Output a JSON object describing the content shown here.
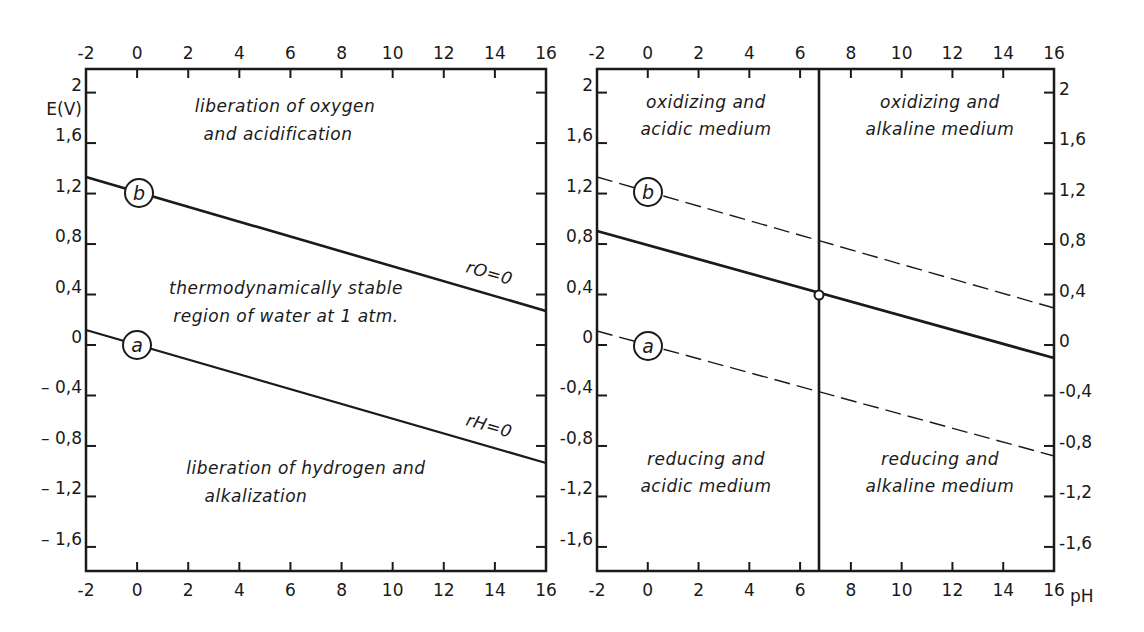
{
  "chart_data": [
    {
      "type": "line",
      "panel": "left",
      "title": "",
      "xlabel": "",
      "ylabel": "E(V)",
      "xlim": [
        -2,
        16
      ],
      "ylim": [
        -1.8,
        2.2
      ],
      "x_ticks": [
        "-2",
        "0",
        "2",
        "4",
        "6",
        "8",
        "10",
        "12",
        "14",
        "16"
      ],
      "y_ticks": [
        "2",
        "1,6",
        "1,2",
        "0,8",
        "0,4",
        "0",
        "– 0,4",
        "– 0,8",
        "– 1,2",
        "– 1,6"
      ],
      "grid": false,
      "series": [
        {
          "name": "b",
          "label": "rO=0",
          "style": "solid",
          "x": [
            -2,
            16
          ],
          "y": [
            1.33,
            0.27
          ]
        },
        {
          "name": "a",
          "label": "rH=0",
          "style": "solid",
          "x": [
            -2,
            16
          ],
          "y": [
            0.12,
            -0.94
          ]
        }
      ],
      "annotations": [
        "liberation of oxygen and acidification",
        "thermodynamically stable region of water at 1 atm.",
        "liberation of hydrogen and alkalization"
      ]
    },
    {
      "type": "line",
      "panel": "right",
      "title": "",
      "xlabel": "pH",
      "ylabel": "",
      "xlim": [
        -2,
        16
      ],
      "ylim": [
        -1.8,
        2.2
      ],
      "x_ticks": [
        "-2",
        "0",
        "2",
        "4",
        "6",
        "8",
        "10",
        "12",
        "14",
        "16"
      ],
      "y_ticks": [
        "2",
        "1,6",
        "1,2",
        "0,8",
        "0,4",
        "0",
        "-0,4",
        "-0,8",
        "-1,2",
        "-1,6"
      ],
      "grid": false,
      "series": [
        {
          "name": "b",
          "style": "dashed",
          "x": [
            -2,
            16
          ],
          "y": [
            1.33,
            0.27
          ]
        },
        {
          "name": "neutral",
          "style": "solid",
          "x": [
            -2,
            16
          ],
          "y": [
            0.93,
            -0.13
          ]
        },
        {
          "name": "a",
          "style": "dashed",
          "x": [
            -2,
            16
          ],
          "y": [
            0.12,
            -0.94
          ]
        },
        {
          "name": "pH 7",
          "style": "solid-vertical",
          "x": [
            7,
            7
          ],
          "y": [
            -1.8,
            2.2
          ]
        }
      ],
      "points": [
        {
          "x": 7,
          "y": 0.4,
          "marker": "open-circle"
        }
      ],
      "annotations": [
        "oxidizing and acidic medium",
        "oxidizing and alkaline medium",
        "reducing and acidic medium",
        "reducing and alkaline medium"
      ]
    }
  ],
  "labels": {
    "y_axis": "E(V)",
    "x_axis": "pH",
    "left": {
      "top_1": "liberation of oxygen",
      "top_2": "and acidification",
      "mid_1": "thermodynamically stable",
      "mid_2": "region of water at 1 atm.",
      "bot_1": "liberation of hydrogen and",
      "bot_2": "alkalization",
      "line_b": "rO=0",
      "line_a": "rH=0",
      "circle_b": "b",
      "circle_a": "a"
    },
    "right": {
      "tl_1": "oxidizing and",
      "tl_2": "acidic medium",
      "tr_1": "oxidizing and",
      "tr_2": "alkaline medium",
      "bl_1": "reducing and",
      "bl_2": "acidic medium",
      "br_1": "reducing and",
      "br_2": "alkaline medium",
      "circle_b": "b",
      "circle_a": "a"
    },
    "x_ticks": [
      "-2",
      "0",
      "2",
      "4",
      "6",
      "8",
      "10",
      "12",
      "14",
      "16"
    ],
    "left_y_ticks": [
      "2",
      "1,6",
      "1,2",
      "0,8",
      "0,4",
      "0",
      "– 0,4",
      "– 0,8",
      "– 1,2",
      "– 1,6"
    ],
    "mid_y_ticks": [
      "2",
      "1,6",
      "1,2",
      "0,8",
      "0,4",
      "0",
      "-0,4",
      "-0,8",
      "-1,2",
      "-1,6"
    ],
    "right_y_ticks": [
      "2",
      "1,6",
      "1,2",
      "0,8",
      "0,4",
      "0",
      "-0,4",
      "-0,8",
      "-1,2",
      "-1,6"
    ]
  },
  "colors": {
    "ink": "#1a1a1a",
    "paper": "#ffffff"
  }
}
